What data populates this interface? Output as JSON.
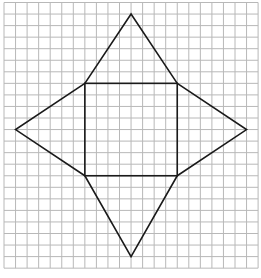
{
  "diagram": {
    "grid": {
      "cols": 22,
      "rows": 23,
      "line_color": "#b8b8b8"
    },
    "shape_color": "#1a1a1a",
    "square": {
      "x1": 7,
      "y1": 7,
      "x2": 15,
      "y2": 15
    },
    "triangles": [
      {
        "name": "top-triangle",
        "apex": [
          11,
          1
        ]
      },
      {
        "name": "left-triangle",
        "apex": [
          1,
          11
        ]
      },
      {
        "name": "right-triangle",
        "apex": [
          21,
          11
        ]
      },
      {
        "name": "bottom-triangle",
        "apex": [
          11,
          22
        ]
      }
    ]
  }
}
